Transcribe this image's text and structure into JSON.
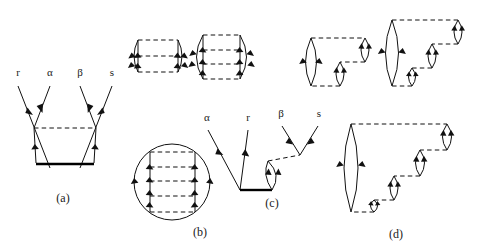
{
  "figure": {
    "kind": "many-body perturbation theory diagrams",
    "background_color": "#ffffff",
    "line_color": "#111111",
    "heavy_line_color": "#000000",
    "captions": [
      {
        "id": "a",
        "text": "(a)",
        "x": 63,
        "y": 202
      },
      {
        "id": "b",
        "text": "(b)",
        "x": 200,
        "y": 235
      },
      {
        "id": "c",
        "text": "(c)",
        "x": 272,
        "y": 206
      },
      {
        "id": "d",
        "text": "(d)",
        "x": 396,
        "y": 237
      }
    ],
    "line_labels": [
      {
        "text": "r",
        "x": 15,
        "y": 76,
        "panel": "a"
      },
      {
        "text": "α",
        "x": 45,
        "y": 76,
        "panel": "a"
      },
      {
        "text": "β",
        "x": 78,
        "y": 76,
        "panel": "a"
      },
      {
        "text": "s",
        "x": 103,
        "y": 76,
        "panel": "a"
      },
      {
        "text": "α",
        "x": 205,
        "y": 120,
        "panel": "c"
      },
      {
        "text": "r",
        "x": 245,
        "y": 120,
        "panel": "c"
      },
      {
        "text": "β",
        "x": 277,
        "y": 116,
        "panel": "c"
      },
      {
        "text": "s",
        "x": 315,
        "y": 116,
        "panel": "c"
      }
    ],
    "panels": [
      {
        "id": "a",
        "name": "panel-a-interaction-vertex",
        "caption": "(a)",
        "description": "Four external particle lines r, alpha, beta, s converging onto a heavy horizontal interaction line, with one dashed horizontal interaction line above it."
      },
      {
        "id": "b",
        "name": "panel-b-ladder-ring",
        "caption": "(b)",
        "description": "Closed ring diagrams: two small cylinder-like ladder diagrams on the top row and one large circular ladder diagram below."
      },
      {
        "id": "c",
        "name": "panel-c-vertex-with-bubble",
        "caption": "(c)",
        "description": "External lines alpha, r meeting a heavy horizontal line, with a lens-shaped bubble connected by a dashed line to external lines beta and s."
      },
      {
        "id": "d",
        "name": "panel-d-bubble-chain",
        "caption": "(d)",
        "description": "A large lens-shaped loop on the left linked by dashed interaction lines to a descending staircase of three small lens-shaped bubbles and a closing bubble at the upper right."
      }
    ]
  }
}
